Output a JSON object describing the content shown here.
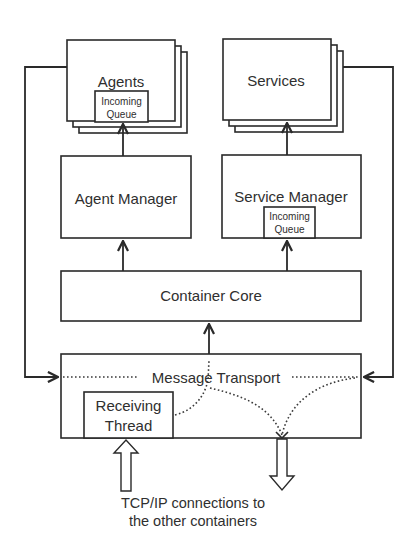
{
  "diagram": {
    "nodes": {
      "agents": {
        "label": "Agents",
        "queue_label_1": "Incoming",
        "queue_label_2": "Queue"
      },
      "services": {
        "label": "Services"
      },
      "agent_manager": {
        "label": "Agent Manager"
      },
      "service_manager": {
        "label": "Service Manager",
        "queue_label_1": "Incoming",
        "queue_label_2": "Queue"
      },
      "container_core": {
        "label": "Container Core"
      },
      "message_transport": {
        "label": "Message Transport"
      },
      "receiving_thread": {
        "label_1": "Receiving",
        "label_2": "Thread"
      }
    },
    "caption": {
      "line_1": "TCP/IP connections to",
      "line_2": "the other containers"
    },
    "edges": [
      {
        "from": "agent_manager",
        "to": "agents",
        "style": "solid-arrow"
      },
      {
        "from": "service_manager",
        "to": "services",
        "style": "solid-arrow"
      },
      {
        "from": "container_core",
        "to": "agent_manager",
        "style": "solid-arrow"
      },
      {
        "from": "container_core",
        "to": "service_manager",
        "style": "solid-arrow"
      },
      {
        "from": "message_transport",
        "to": "container_core",
        "style": "solid-arrow"
      },
      {
        "from": "agents",
        "to": "message_transport",
        "style": "solid-arrow"
      },
      {
        "from": "services",
        "to": "message_transport",
        "style": "solid-arrow"
      },
      {
        "from": "receiving_thread",
        "to": "message_transport",
        "style": "dotted"
      },
      {
        "from": "message_transport",
        "to": "tcp_out",
        "style": "dotted"
      },
      {
        "from": "tcp_in",
        "to": "receiving_thread",
        "style": "hollow-arrow"
      },
      {
        "from": "message_transport",
        "to": "tcp_out",
        "style": "hollow-arrow"
      }
    ]
  }
}
